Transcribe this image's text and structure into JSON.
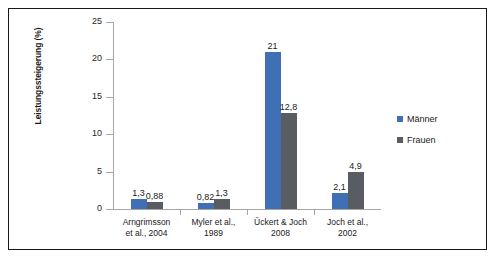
{
  "chart_data": {
    "type": "bar",
    "title": "",
    "xlabel": "",
    "ylabel": "Leistungssteigerung (%)",
    "ylim": [
      0,
      25
    ],
    "yticks": [
      0,
      5,
      10,
      15,
      20,
      25
    ],
    "ytick_labels": [
      "0",
      "5",
      "10",
      "15",
      "20",
      "25"
    ],
    "grid": false,
    "legend_position": "right",
    "categories": [
      "Arngrimsson et al., 2004",
      "Myler et al., 1989",
      "Ückert & Joch 2008",
      "Joch et al., 2002"
    ],
    "category_lines": [
      [
        "Arngrimsson",
        "et al., 2004"
      ],
      [
        "Myler et al.,",
        "1989"
      ],
      [
        "Ückert & Joch",
        "2008"
      ],
      [
        "Joch et al.,",
        "2002"
      ]
    ],
    "series": [
      {
        "name": "Männer",
        "color": "#3f6fb5",
        "values": [
          1.3,
          0.82,
          21,
          2.1
        ],
        "labels": [
          "1,3",
          "0,82",
          "21",
          "2,1"
        ]
      },
      {
        "name": "Frauen",
        "color": "#595d62",
        "values": [
          0.88,
          1.3,
          12.8,
          4.9
        ],
        "labels": [
          "0,88",
          "1,3",
          "12,8",
          "4,9"
        ]
      }
    ]
  },
  "legend": {
    "items": [
      {
        "label": "Männer",
        "color": "#3f6fb5"
      },
      {
        "label": "Frauen",
        "color": "#595d62"
      }
    ]
  },
  "colors": {
    "maenner": "#3f6fb5",
    "frauen": "#595d62",
    "axis": "#a6a6a6",
    "frame": "#1a1a1a",
    "text": "#1a1a1a",
    "background": "#ffffff"
  }
}
